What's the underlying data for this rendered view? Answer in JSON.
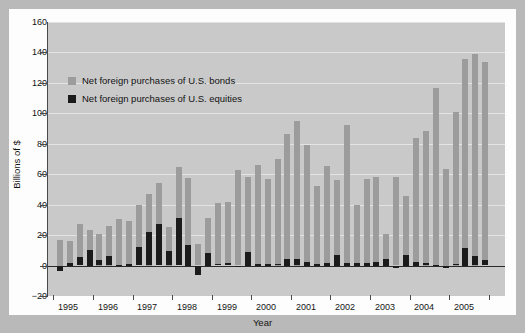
{
  "chart_data": {
    "type": "bar",
    "title": "",
    "xlabel": "Year",
    "ylabel": "Billions of $",
    "ylim": [
      -20,
      160
    ],
    "ytick_step": 20,
    "yticks": [
      -20,
      0,
      20,
      40,
      60,
      80,
      100,
      120,
      140,
      160
    ],
    "grid": true,
    "stacked": true,
    "legend_position": "upper-left",
    "categories": [
      "1995Q1",
      "1995Q2",
      "1995Q3",
      "1995Q4",
      "1996Q1",
      "1996Q2",
      "1996Q3",
      "1996Q4",
      "1997Q1",
      "1997Q2",
      "1997Q3",
      "1997Q4",
      "1998Q1",
      "1998Q2",
      "1998Q3",
      "1998Q4",
      "1999Q1",
      "1999Q2",
      "1999Q3",
      "1999Q4",
      "2000Q1",
      "2000Q2",
      "2000Q3",
      "2000Q4",
      "2001Q1",
      "2001Q2",
      "2001Q3",
      "2001Q4",
      "2002Q1",
      "2002Q2",
      "2002Q3",
      "2002Q4",
      "2003Q1",
      "2003Q2",
      "2003Q3",
      "2003Q4",
      "2004Q1",
      "2004Q2",
      "2004Q3",
      "2004Q4",
      "2005Q1",
      "2005Q2",
      "2005Q3",
      "2005Q4"
    ],
    "xtick_labels": [
      "1995",
      "1996",
      "1997",
      "1998",
      "1999",
      "2000",
      "2001",
      "2002",
      "2003",
      "2004",
      "2005"
    ],
    "series": [
      {
        "name": "Net foreign purchases of U.S. bonds",
        "color": "#9c9c9c",
        "values": [
          17,
          16,
          27,
          23.5,
          21,
          26,
          30.5,
          29.5,
          39.5,
          47,
          54,
          25.5,
          64.5,
          57.5,
          14,
          31,
          41,
          41.5,
          62.5,
          58.5,
          66,
          57,
          70,
          86.5,
          95,
          79,
          52,
          65.5,
          56.5,
          92.5,
          39.5,
          57,
          58.5,
          21,
          58,
          46,
          83.5,
          88.5,
          116.5,
          63.5,
          101,
          136,
          139,
          133.5
        ]
      },
      {
        "name": "Net foreign purchases of U.S. equities",
        "color": "#1b1b1b",
        "values": [
          -3.5,
          2,
          5.5,
          10.5,
          3.5,
          6,
          0.5,
          1,
          12,
          22,
          27,
          9.5,
          31,
          13.5,
          -6,
          8.5,
          0.8,
          1.5,
          -0.8,
          9,
          1.3,
          1,
          0.7,
          4.5,
          4,
          2.5,
          1,
          2,
          7,
          1.8,
          2,
          2,
          2.5,
          4.5,
          -1.5,
          7,
          2.5,
          1.5,
          0.6,
          -1,
          0.8,
          11.5,
          6,
          3.5
        ]
      }
    ]
  },
  "legend": {
    "items": [
      {
        "label": "Net foreign purchases of U.S. bonds",
        "swatch": "bond"
      },
      {
        "label": "Net foreign purchases of U.S. equities",
        "swatch": "eq"
      }
    ]
  },
  "colors": {
    "plot_background": "#c9c9c9",
    "card_background": "#fdfdfd",
    "page_background": "#b9b9b9",
    "gridline": "#e3e3e3",
    "axis": "#4a4a4a",
    "bond_bar": "#9c9c9c",
    "equity_bar": "#1b1b1b"
  }
}
